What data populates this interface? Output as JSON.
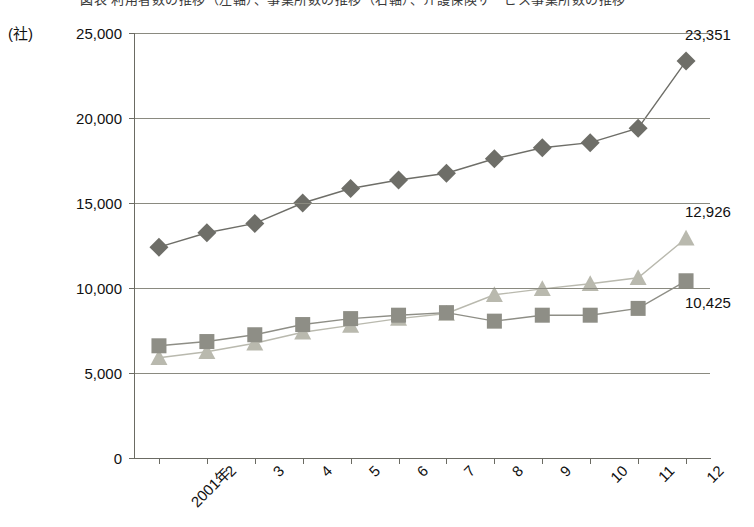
{
  "title": {
    "text": "図表 利用者数の推移（左軸）、事業所数の推移（右軸）、介護保険サービス事業所数の推移",
    "clipped": true
  },
  "chart_data": {
    "type": "line",
    "title": "",
    "xlabel": "",
    "ylabel": "(社)",
    "unit_label": "(社)",
    "ylim": [
      0,
      25000
    ],
    "ytick_labels": [
      "0",
      "5,000",
      "10,000",
      "15,000",
      "20,000",
      "25,000"
    ],
    "ytick_values": [
      0,
      5000,
      10000,
      15000,
      20000,
      25000
    ],
    "grid": true,
    "legend_position": "none",
    "categories": [
      "2001年",
      "2",
      "3",
      "4",
      "5",
      "6",
      "7",
      "8",
      "9",
      "10",
      "11",
      "12"
    ],
    "series": [
      {
        "name": "diamond-series",
        "marker": "diamond",
        "color": "#6e6e68",
        "end_label": "23,351",
        "values": [
          12400,
          13250,
          13800,
          15000,
          15850,
          16350,
          16750,
          17600,
          18250,
          18550,
          19400,
          23351
        ]
      },
      {
        "name": "triangle-series",
        "marker": "triangle",
        "color": "#b9b9ae",
        "end_label": "12,926",
        "values": [
          5900,
          6250,
          6750,
          7400,
          7800,
          8200,
          8500,
          9600,
          9950,
          10250,
          10600,
          12926
        ]
      },
      {
        "name": "square-series",
        "marker": "square",
        "color": "#8e8e86",
        "end_label": "10,425",
        "values": [
          6600,
          6850,
          7250,
          7850,
          8200,
          8400,
          8550,
          8050,
          8400,
          8400,
          8800,
          10425
        ]
      }
    ],
    "callouts": [
      {
        "label": "23,351",
        "series": "diamond-series"
      },
      {
        "label": "12,926",
        "series": "triangle-series"
      },
      {
        "label": "10,425",
        "series": "square-series"
      }
    ]
  }
}
